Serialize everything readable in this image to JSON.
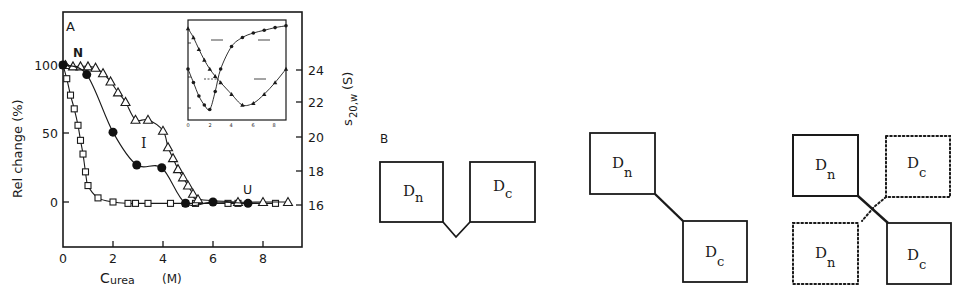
{
  "panel_a": {
    "label": "A",
    "state_labels": {
      "native": "N",
      "intermediate": "I",
      "unfolded": "U"
    },
    "y_left_label": "Rel change (%)",
    "y_right_label_main": "s",
    "y_right_label_sub": "20,w",
    "y_right_label_unit": "(S)",
    "x_label_main": "C",
    "x_label_sub": "urea",
    "x_label_unit": "(M)",
    "x_ticks": [
      "0",
      "2",
      "4",
      "6",
      "8"
    ],
    "y_left_ticks": [
      "100",
      "50",
      "0"
    ],
    "y_right_ticks": [
      "24",
      "22",
      "20",
      "18",
      "16"
    ]
  },
  "panel_b": {
    "label": "B",
    "domain_n": "D",
    "domain_n_sub": "n",
    "domain_c": "D",
    "domain_c_sub": "c"
  },
  "chart_data": {
    "type": "line",
    "title": "",
    "xlabel": "C_urea (M)",
    "ylabel": "Rel change (%)",
    "ylabel_right": "s20,w (S)",
    "xlim": [
      0,
      9.5
    ],
    "ylim": [
      -30,
      130
    ],
    "ylim_right": [
      16,
      24
    ],
    "grid": false,
    "legend": "none",
    "annotations": [
      "N",
      "I",
      "U"
    ],
    "series": [
      {
        "name": "open squares",
        "marker": "square-open",
        "x": [
          0,
          0.15,
          0.3,
          0.45,
          0.6,
          0.7,
          0.8,
          0.9,
          1.0,
          1.4,
          2.0,
          2.6,
          2.9,
          3.4,
          4.3,
          4.9,
          5.3,
          6.6,
          7.0,
          8.5
        ],
        "values": [
          100,
          90,
          78,
          68,
          56,
          45,
          35,
          22,
          12,
          3,
          0,
          -1,
          -1,
          -1,
          -1,
          -1,
          -1,
          -1,
          -1,
          -1
        ]
      },
      {
        "name": "open triangles",
        "marker": "triangle-open",
        "x": [
          0.1,
          0.4,
          0.7,
          1.0,
          1.3,
          1.6,
          1.9,
          2.2,
          2.5,
          2.9,
          3.4,
          4.0,
          4.2,
          4.4,
          4.6,
          4.8,
          5.0,
          5.2,
          5.4,
          7.0,
          8.0,
          9.0
        ],
        "values": [
          100,
          99,
          99,
          99,
          98,
          94,
          88,
          80,
          73,
          60,
          60,
          52,
          40,
          32,
          24,
          18,
          12,
          6,
          2,
          0,
          0,
          0
        ]
      },
      {
        "name": "filled circles",
        "marker": "circle-filled",
        "x": [
          0,
          0.95,
          2.0,
          2.95,
          3.95,
          4.9,
          6.0,
          7.4
        ],
        "values": [
          100,
          93,
          51,
          27,
          25,
          -1,
          0,
          -1
        ]
      }
    ],
    "inset": {
      "type": "line",
      "xlim": [
        0,
        9
      ],
      "x_ticks": [
        "0",
        "2",
        "4",
        "6",
        "8"
      ],
      "series": [
        {
          "name": "falling-rising (upper-left to lower, rising right)",
          "x": [
            0,
            0.5,
            1,
            1.5,
            2,
            2.5,
            3,
            4,
            5,
            6,
            7,
            8,
            9
          ],
          "values": [
            0.95,
            0.85,
            0.72,
            0.6,
            0.5,
            0.42,
            0.35,
            0.22,
            0.1,
            0.12,
            0.22,
            0.35,
            0.5
          ]
        },
        {
          "name": "V-shape (min at 2)",
          "x": [
            0,
            0.5,
            1,
            1.5,
            2,
            2.5,
            3,
            4,
            5,
            6,
            7,
            8,
            9
          ],
          "values": [
            0.5,
            0.35,
            0.2,
            0.1,
            0.05,
            0.25,
            0.5,
            0.75,
            0.85,
            0.9,
            0.93,
            0.96,
            0.98
          ]
        }
      ]
    }
  }
}
